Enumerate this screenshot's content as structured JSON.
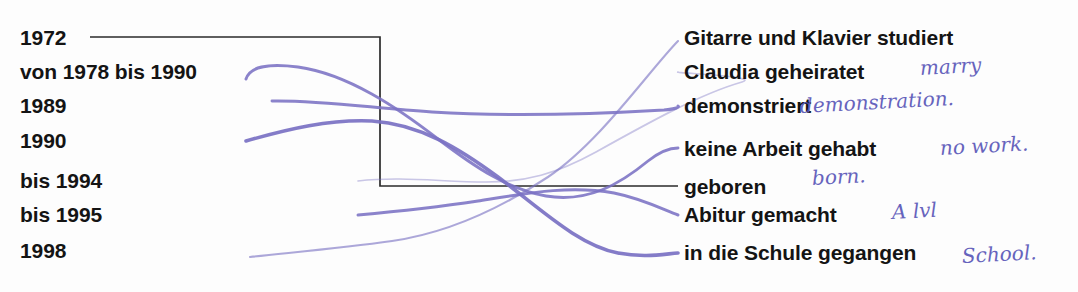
{
  "worksheet": {
    "kind": "matching-exercise",
    "left_column": [
      {
        "id": "l1",
        "text": "1972",
        "y": 37
      },
      {
        "id": "l2",
        "text": "von 1978 bis 1990",
        "y": 71
      },
      {
        "id": "l3",
        "text": "1989",
        "y": 105
      },
      {
        "id": "l4",
        "text": "1990",
        "y": 140
      },
      {
        "id": "l5",
        "text": "bis 1994",
        "y": 180
      },
      {
        "id": "l6",
        "text": "bis 1995",
        "y": 214
      },
      {
        "id": "l7",
        "text": "1998",
        "y": 250
      }
    ],
    "right_column": [
      {
        "id": "r1",
        "text": "Gitarre und Klavier studiert",
        "y": 37
      },
      {
        "id": "r2",
        "text": "Claudia geheiratet",
        "y": 71
      },
      {
        "id": "r3",
        "text": "demonstriert",
        "y": 105
      },
      {
        "id": "r4",
        "text": "keine Arbeit gehabt",
        "y": 148
      },
      {
        "id": "r5",
        "text": "geboren",
        "y": 186
      },
      {
        "id": "r6",
        "text": "Abitur gemacht",
        "y": 214
      },
      {
        "id": "r7",
        "text": "in die Schule gegangen",
        "y": 252
      }
    ],
    "annotations": [
      {
        "id": "a1",
        "text": "marry",
        "for": "r2",
        "x": 920,
        "y": 68
      },
      {
        "id": "a2",
        "text": "demonstration.",
        "for": "r3",
        "x": 800,
        "y": 106
      },
      {
        "id": "a3",
        "text": "no work.",
        "for": "r4",
        "x": 940,
        "y": 148
      },
      {
        "id": "a4",
        "text": "born.",
        "for": "r5",
        "x": 812,
        "y": 178
      },
      {
        "id": "a5",
        "text": "A lvl",
        "for": "r6",
        "x": 892,
        "y": 212
      },
      {
        "id": "a6",
        "text": "School.",
        "for": "r7",
        "x": 962,
        "y": 256
      }
    ],
    "connections": [
      {
        "from": "l1",
        "to": "r5",
        "style": "black-ruled",
        "path": "M 90 37 L 380 37 L 380 186 L 678 186"
      },
      {
        "from": "l2",
        "to": "r4",
        "style": "pen-medium",
        "path": "M 247 77 C 252 66, 268 64, 300 68 C 352 76, 400 110, 440 140 C 478 169, 510 188, 548 195 C 590 203, 620 186, 648 162 C 662 151, 670 148, 676 148"
      },
      {
        "from": "l3",
        "to": "r3",
        "style": "pen-medium",
        "path": "M 272 101 C 330 101, 400 111, 470 113 C 560 115, 640 110, 700 108 C 740 107, 760 105, 676 105"
      },
      {
        "from": "l4",
        "to": "r7",
        "style": "pen-thick",
        "path": "M 248 140 C 290 128, 330 118, 372 120 C 420 123, 462 148, 500 176 C 545 210, 580 244, 620 252 C 645 257, 662 254, 676 252"
      },
      {
        "from": "l5",
        "to": "r2",
        "style": "pen-faint",
        "path": "M 360 180 C 410 176, 450 180, 490 180 C 530 180, 560 172, 600 150 C 650 122, 700 92, 740 80 C 768 72, 790 70, 676 71"
      },
      {
        "from": "l6",
        "to": "r6",
        "style": "pen-medium",
        "path": "M 360 214 C 405 210, 440 206, 480 200 C 530 192, 570 184, 615 192 C 645 198, 665 210, 676 214"
      },
      {
        "from": "l7",
        "to": "r1",
        "style": "pen-thin",
        "path": "M 250 256 C 300 250, 350 246, 400 240 C 460 232, 520 200, 580 160 C 630 126, 660 60, 676 40"
      }
    ],
    "colors": {
      "ink_purple": "#7b72c4",
      "ruled_black": "#2b2b2b",
      "text_black": "#141414",
      "hand_blue": "#5a57b8",
      "paper": "#fdfdfd"
    }
  }
}
